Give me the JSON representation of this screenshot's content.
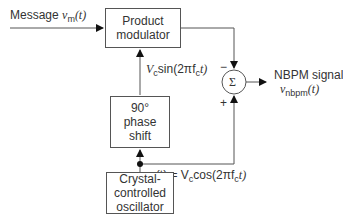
{
  "blocks": {
    "product_modulator": {
      "line1": "Product",
      "line2": "modulator"
    },
    "phase_shift": {
      "line1": "90°",
      "line2": "phase shift"
    },
    "oscillator": {
      "line1": "Crystal-",
      "line2": "controlled",
      "line3": "oscillator"
    },
    "summer": {
      "symbol": "Σ"
    }
  },
  "labels": {
    "message": "Message",
    "message_var": "v",
    "message_sub": "m",
    "message_arg": "(t)",
    "sin_signal": {
      "V": "V",
      "sub": "c",
      "rest": "sin(2πf",
      "sub2": "c",
      "end": "t)"
    },
    "cos_signal": {
      "v": "v",
      "sub": "c",
      "mid": "(t) = V",
      "sub2": "c",
      "rest": "cos(2πf",
      "sub3": "c",
      "end": "t)"
    },
    "minus": "−",
    "plus": "+",
    "output_title": "NBPM signal",
    "output_var": "v",
    "output_sub": "nbpm",
    "output_arg": "(t)"
  }
}
